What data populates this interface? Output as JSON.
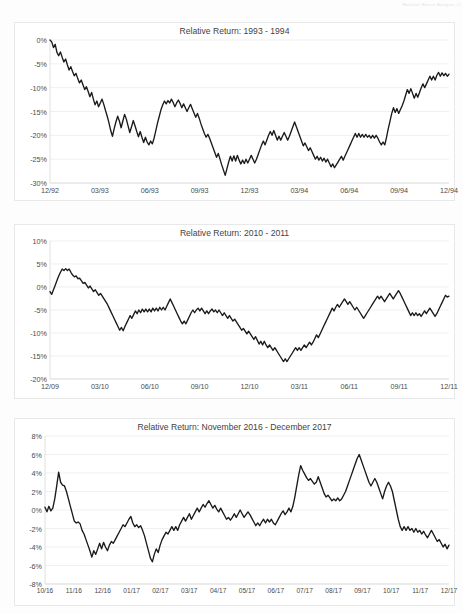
{
  "page": {
    "header_text": "Relative Return Analysis",
    "page_number": "32"
  },
  "charts": [
    {
      "id": "chart-1",
      "title": "Relative Return: 1993 - 1994",
      "yticks": [
        "0%",
        "-5%",
        "-10%",
        "-15%",
        "-20%",
        "-25%",
        "-30%"
      ],
      "xticks": [
        "12/92",
        "03/93",
        "06/93",
        "09/93",
        "12/93",
        "03/94",
        "06/94",
        "09/94",
        "12/94"
      ]
    },
    {
      "id": "chart-2",
      "title": "Relative Return: 2010 - 2011",
      "yticks": [
        "10%",
        "5%",
        "0%",
        "-5%",
        "-10%",
        "-15%",
        "-20%"
      ],
      "xticks": [
        "12/09",
        "03/10",
        "06/10",
        "09/10",
        "12/10",
        "03/11",
        "06/11",
        "09/11",
        "12/11"
      ]
    },
    {
      "id": "chart-3",
      "title": "Relative Return: November 2016 - December 2017",
      "yticks": [
        "8%",
        "6%",
        "4%",
        "2%",
        "0%",
        "-2%",
        "-4%",
        "-6%",
        "-8%"
      ],
      "xticks": [
        "10/16",
        "11/16",
        "12/16",
        "01/17",
        "02/17",
        "03/17",
        "04/17",
        "05/17",
        "06/17",
        "07/17",
        "08/17",
        "09/17",
        "10/17",
        "11/17",
        "12/17"
      ]
    }
  ],
  "chart_data": [
    {
      "type": "line",
      "title": "Relative Return: 1993 - 1994",
      "xlabel": "",
      "ylabel": "Relative Return (%)",
      "ylim": [
        -30,
        0
      ],
      "xlim": [
        "12/92",
        "12/94"
      ],
      "grid": true,
      "legend": "none",
      "series_color": "#1a1a1a",
      "x_tick_labels": [
        "12/92",
        "03/93",
        "06/93",
        "09/93",
        "12/93",
        "03/94",
        "06/94",
        "09/94",
        "12/94"
      ],
      "y_tick_values": [
        0,
        -5,
        -10,
        -15,
        -20,
        -25,
        -30
      ],
      "values": [
        0.0,
        -0.4,
        -1.6,
        -0.9,
        -2.6,
        -3.3,
        -2.5,
        -3.6,
        -4.6,
        -4.0,
        -5.2,
        -6.3,
        -5.6,
        -6.6,
        -7.5,
        -7.0,
        -8.1,
        -9.0,
        -8.4,
        -9.4,
        -10.4,
        -9.8,
        -10.8,
        -11.9,
        -11.0,
        -12.4,
        -13.6,
        -12.8,
        -14.0,
        -13.2,
        -12.4,
        -13.5,
        -14.8,
        -16.0,
        -17.4,
        -19.0,
        -20.2,
        -18.6,
        -17.2,
        -16.0,
        -17.0,
        -18.4,
        -17.0,
        -15.6,
        -16.6,
        -18.0,
        -19.4,
        -18.2,
        -16.9,
        -18.0,
        -19.2,
        -20.3,
        -19.2,
        -20.4,
        -21.5,
        -20.4,
        -21.4,
        -22.0,
        -21.2,
        -21.8,
        -20.6,
        -19.0,
        -17.4,
        -16.0,
        -14.6,
        -13.6,
        -12.8,
        -13.4,
        -12.7,
        -13.2,
        -12.4,
        -13.1,
        -14.0,
        -13.2,
        -12.6,
        -13.3,
        -14.2,
        -13.4,
        -14.2,
        -15.0,
        -14.2,
        -13.5,
        -14.4,
        -15.3,
        -16.2,
        -15.4,
        -16.4,
        -17.6,
        -18.6,
        -19.6,
        -20.4,
        -19.8,
        -20.6,
        -21.6,
        -22.6,
        -23.6,
        -24.6,
        -23.8,
        -25.0,
        -26.2,
        -27.3,
        -28.4,
        -27.0,
        -25.6,
        -24.4,
        -25.4,
        -24.3,
        -25.4,
        -24.2,
        -25.2,
        -26.0,
        -25.2,
        -25.9,
        -25.0,
        -25.8,
        -25.0,
        -24.2,
        -25.0,
        -25.8,
        -25.0,
        -24.0,
        -23.0,
        -22.0,
        -21.2,
        -22.0,
        -21.0,
        -20.0,
        -19.2,
        -20.0,
        -19.0,
        -20.0,
        -21.0,
        -20.2,
        -21.0,
        -20.2,
        -19.4,
        -20.2,
        -21.0,
        -20.2,
        -19.2,
        -18.2,
        -17.2,
        -18.2,
        -19.2,
        -20.2,
        -21.2,
        -22.2,
        -21.6,
        -22.4,
        -23.2,
        -22.6,
        -23.4,
        -24.2,
        -25.0,
        -24.4,
        -25.2,
        -24.6,
        -25.4,
        -24.8,
        -25.6,
        -25.0,
        -25.8,
        -26.6,
        -26.0,
        -26.8,
        -26.2,
        -25.6,
        -25.0,
        -24.4,
        -25.2,
        -24.4,
        -23.6,
        -22.8,
        -22.0,
        -21.2,
        -20.4,
        -19.6,
        -20.4,
        -19.6,
        -20.4,
        -19.8,
        -20.4,
        -19.8,
        -20.4,
        -20.0,
        -20.6,
        -20.0,
        -20.6,
        -20.0,
        -20.6,
        -21.4,
        -22.0,
        -21.4,
        -22.0,
        -20.4,
        -18.6,
        -17.0,
        -15.4,
        -14.2,
        -15.2,
        -14.4,
        -15.4,
        -14.6,
        -13.8,
        -12.8,
        -11.6,
        -10.4,
        -11.2,
        -10.2,
        -11.2,
        -12.2,
        -11.2,
        -12.0,
        -11.0,
        -10.0,
        -9.2,
        -10.0,
        -9.2,
        -8.4,
        -7.6,
        -8.4,
        -7.6,
        -8.4,
        -7.4,
        -6.8,
        -7.6,
        -6.9,
        -7.5,
        -7.0,
        -7.6,
        -7.2
      ]
    },
    {
      "type": "line",
      "title": "Relative Return: 2010 - 2011",
      "xlabel": "",
      "ylabel": "Relative Return (%)",
      "ylim": [
        -20,
        10
      ],
      "xlim": [
        "12/09",
        "12/11"
      ],
      "grid": true,
      "legend": "none",
      "series_color": "#1a1a1a",
      "x_tick_labels": [
        "12/09",
        "03/10",
        "06/10",
        "09/10",
        "12/10",
        "03/11",
        "06/11",
        "09/11",
        "12/11"
      ],
      "y_tick_values": [
        10,
        5,
        0,
        -5,
        -10,
        -15,
        -20
      ],
      "values": [
        -1.0,
        -1.6,
        -0.6,
        0.4,
        1.4,
        2.4,
        3.2,
        3.9,
        3.6,
        4.0,
        3.6,
        3.9,
        3.2,
        2.6,
        2.2,
        2.4,
        1.8,
        1.9,
        1.4,
        0.8,
        1.0,
        0.4,
        -0.2,
        0.2,
        -0.4,
        -1.0,
        -0.6,
        -1.2,
        -1.8,
        -1.4,
        -2.0,
        -2.6,
        -3.2,
        -3.8,
        -4.6,
        -5.4,
        -6.2,
        -7.0,
        -7.8,
        -8.6,
        -9.4,
        -8.8,
        -9.5,
        -8.6,
        -7.8,
        -7.0,
        -6.2,
        -6.8,
        -6.0,
        -5.2,
        -5.8,
        -5.0,
        -5.6,
        -4.8,
        -5.4,
        -4.8,
        -5.4,
        -4.8,
        -5.4,
        -4.6,
        -5.2,
        -4.6,
        -5.2,
        -4.4,
        -5.0,
        -4.4,
        -5.0,
        -4.2,
        -3.4,
        -2.6,
        -3.4,
        -4.2,
        -5.0,
        -5.8,
        -6.6,
        -7.4,
        -8.0,
        -7.4,
        -8.0,
        -7.2,
        -6.4,
        -5.6,
        -5.0,
        -5.6,
        -5.0,
        -4.6,
        -5.2,
        -4.6,
        -5.2,
        -5.8,
        -5.2,
        -5.8,
        -5.2,
        -4.8,
        -5.4,
        -5.0,
        -5.6,
        -5.0,
        -5.6,
        -6.2,
        -5.6,
        -6.2,
        -6.8,
        -6.2,
        -6.8,
        -7.4,
        -7.0,
        -7.6,
        -8.2,
        -8.8,
        -9.4,
        -9.0,
        -9.6,
        -10.2,
        -9.6,
        -10.2,
        -10.8,
        -11.4,
        -10.8,
        -11.6,
        -12.4,
        -11.8,
        -12.6,
        -11.8,
        -12.6,
        -13.2,
        -12.6,
        -13.2,
        -13.8,
        -13.2,
        -13.8,
        -14.4,
        -15.0,
        -15.6,
        -16.2,
        -15.6,
        -16.2,
        -15.6,
        -15.0,
        -14.4,
        -13.8,
        -13.2,
        -13.8,
        -13.2,
        -13.8,
        -13.2,
        -12.6,
        -13.2,
        -12.6,
        -12.0,
        -12.6,
        -12.0,
        -11.2,
        -10.4,
        -11.0,
        -10.2,
        -9.4,
        -8.6,
        -7.8,
        -7.0,
        -6.2,
        -5.4,
        -4.6,
        -5.2,
        -4.4,
        -3.8,
        -4.4,
        -3.8,
        -3.2,
        -2.6,
        -3.2,
        -3.8,
        -3.2,
        -3.8,
        -4.4,
        -5.0,
        -4.4,
        -5.0,
        -5.6,
        -6.2,
        -6.8,
        -6.2,
        -5.6,
        -5.0,
        -4.4,
        -3.8,
        -3.2,
        -2.6,
        -2.0,
        -2.6,
        -2.0,
        -2.6,
        -3.2,
        -2.6,
        -2.0,
        -1.4,
        -2.0,
        -2.6,
        -2.0,
        -1.4,
        -0.8,
        -1.4,
        -2.2,
        -3.0,
        -3.8,
        -4.6,
        -5.4,
        -6.2,
        -5.6,
        -6.2,
        -5.6,
        -6.2,
        -5.8,
        -6.4,
        -5.8,
        -5.2,
        -5.8,
        -5.2,
        -4.6,
        -5.2,
        -5.8,
        -6.4,
        -5.8,
        -5.0,
        -4.2,
        -3.4,
        -2.6,
        -1.8,
        -2.2,
        -2.0
      ]
    },
    {
      "type": "line",
      "title": "Relative Return: November 2016 - December 2017",
      "xlabel": "",
      "ylabel": "Relative Return (%)",
      "ylim": [
        -8,
        8
      ],
      "xlim": [
        "10/16",
        "12/17"
      ],
      "grid": true,
      "legend": "none",
      "series_color": "#1a1a1a",
      "x_tick_labels": [
        "10/16",
        "11/16",
        "12/16",
        "01/17",
        "02/17",
        "03/17",
        "04/17",
        "05/17",
        "06/17",
        "07/17",
        "08/17",
        "09/17",
        "10/17",
        "11/17",
        "12/17"
      ],
      "y_tick_values": [
        8,
        6,
        4,
        2,
        0,
        -2,
        -4,
        -6,
        -8
      ],
      "values": [
        0.3,
        -0.2,
        0.4,
        -0.1,
        0.2,
        1.2,
        2.6,
        4.1,
        3.0,
        2.7,
        2.6,
        2.0,
        1.2,
        0.4,
        -0.4,
        -1.2,
        -1.4,
        -1.3,
        -1.5,
        -2.2,
        -2.6,
        -3.2,
        -3.8,
        -4.4,
        -5.1,
        -4.4,
        -4.8,
        -4.2,
        -3.6,
        -4.2,
        -3.5,
        -4.0,
        -4.4,
        -3.8,
        -3.4,
        -3.6,
        -3.2,
        -2.8,
        -2.4,
        -2.0,
        -1.6,
        -1.8,
        -1.4,
        -1.0,
        -0.7,
        -1.4,
        -1.8,
        -1.6,
        -1.9,
        -1.7,
        -2.2,
        -2.8,
        -3.6,
        -4.4,
        -5.2,
        -5.6,
        -4.8,
        -4.2,
        -4.6,
        -3.8,
        -3.2,
        -2.8,
        -2.4,
        -2.6,
        -2.2,
        -1.8,
        -2.2,
        -1.8,
        -2.2,
        -1.6,
        -1.2,
        -0.8,
        -1.2,
        -0.8,
        -0.4,
        -1.0,
        -0.6,
        -0.2,
        0.2,
        -0.2,
        0.2,
        0.6,
        0.3,
        0.7,
        1.0,
        0.6,
        0.2,
        0.5,
        0.1,
        -0.2,
        0.2,
        -0.2,
        -0.6,
        -1.0,
        -0.8,
        -1.1,
        -0.8,
        -0.4,
        -0.8,
        -0.4,
        0.0,
        -0.4,
        -0.8,
        -0.5,
        -0.2,
        -0.5,
        -0.9,
        -1.3,
        -1.7,
        -1.4,
        -1.7,
        -1.3,
        -1.0,
        -1.4,
        -1.0,
        -1.3,
        -1.0,
        -1.4,
        -1.6,
        -1.2,
        -0.8,
        -0.4,
        -0.1,
        -0.5,
        -0.2,
        0.2,
        -0.2,
        0.4,
        1.4,
        2.6,
        3.8,
        4.8,
        4.3,
        3.9,
        3.5,
        3.2,
        3.4,
        3.1,
        2.8,
        3.0,
        3.6,
        3.0,
        2.4,
        1.8,
        1.4,
        1.6,
        1.3,
        1.0,
        1.2,
        1.0,
        1.3,
        1.0,
        1.2,
        1.6,
        2.0,
        2.6,
        3.2,
        3.8,
        4.4,
        5.0,
        5.6,
        6.0,
        5.4,
        4.8,
        4.2,
        3.6,
        3.0,
        2.6,
        3.0,
        3.4,
        3.0,
        2.4,
        1.8,
        1.2,
        2.0,
        2.6,
        3.0,
        2.6,
        2.0,
        1.0,
        0.0,
        -1.0,
        -1.8,
        -2.2,
        -1.8,
        -2.2,
        -1.8,
        -2.2,
        -2.0,
        -2.4,
        -2.0,
        -2.4,
        -2.2,
        -2.6,
        -2.3,
        -2.7,
        -3.0,
        -2.6,
        -2.2,
        -2.6,
        -3.0,
        -3.4,
        -3.2,
        -3.6,
        -4.0,
        -3.7,
        -4.2,
        -3.8
      ]
    }
  ]
}
